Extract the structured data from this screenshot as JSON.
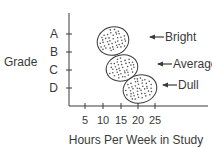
{
  "chart_data": {
    "type": "scatter",
    "title": "",
    "xlabel": "Hours Per Week in Study",
    "ylabel": "Grade",
    "x_ticks": [
      "5",
      "10",
      "15",
      "20",
      "25"
    ],
    "y_ticks": [
      "A",
      "B",
      "C",
      "D"
    ],
    "grid": false,
    "clusters": [
      {
        "name": "Bright",
        "x_center": 12.5,
        "y_center": "A-B",
        "x_range": [
          8,
          17
        ]
      },
      {
        "name": "Average",
        "x_center": 15,
        "y_center": "C",
        "x_range": [
          11,
          19.5
        ]
      },
      {
        "name": "Dull",
        "x_center": 20,
        "y_center": "D",
        "x_range": [
          15.5,
          24.5
        ]
      }
    ],
    "annotations": [
      "Bright",
      "Average",
      "Dull"
    ]
  },
  "colors": {
    "line": "#3a3a3a",
    "background": "#ffffff"
  }
}
